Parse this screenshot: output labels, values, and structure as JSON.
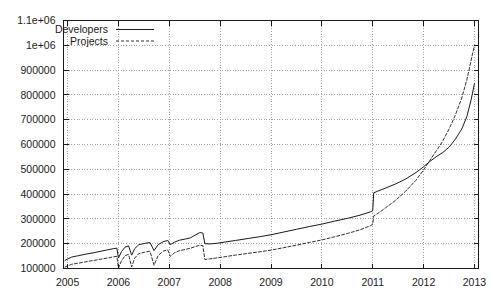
{
  "chart_data": {
    "type": "line",
    "title": "",
    "xlabel": "",
    "ylabel": "",
    "xlim": [
      2004.92,
      2013.08
    ],
    "ylim": [
      100000,
      1100000
    ],
    "grid": true,
    "legend_position": "top-left-inside",
    "xticks": [
      "2005",
      "2006",
      "2007",
      "2008",
      "2009",
      "2010",
      "2011",
      "2012",
      "2013"
    ],
    "xtick_values": [
      2005,
      2006,
      2007,
      2008,
      2009,
      2010,
      2011,
      2012,
      2013
    ],
    "yticks": [
      "100000",
      "200000",
      "300000",
      "400000",
      "500000",
      "600000",
      "700000",
      "800000",
      "900000",
      "1e+06",
      "1.1e+06"
    ],
    "ytick_values": [
      100000,
      200000,
      300000,
      400000,
      500000,
      600000,
      700000,
      800000,
      900000,
      1000000,
      1100000
    ],
    "series": [
      {
        "name": "Developers",
        "style": "solid",
        "color": "#1a1a1a",
        "points": [
          [
            2004.95,
            133000
          ],
          [
            2005.08,
            146000
          ],
          [
            2005.22,
            152000
          ],
          [
            2005.36,
            158000
          ],
          [
            2005.5,
            163000
          ],
          [
            2005.64,
            169000
          ],
          [
            2005.78,
            175000
          ],
          [
            2005.9,
            180000
          ],
          [
            2005.97,
            182000
          ],
          [
            2006.0,
            142000
          ],
          [
            2006.06,
            168000
          ],
          [
            2006.13,
            186000
          ],
          [
            2006.2,
            191000
          ],
          [
            2006.26,
            154000
          ],
          [
            2006.32,
            180000
          ],
          [
            2006.4,
            196000
          ],
          [
            2006.52,
            201000
          ],
          [
            2006.62,
            205000
          ],
          [
            2006.7,
            172000
          ],
          [
            2006.78,
            196000
          ],
          [
            2006.88,
            208000
          ],
          [
            2006.97,
            213000
          ],
          [
            2007.02,
            196000
          ],
          [
            2007.1,
            206000
          ],
          [
            2007.2,
            214000
          ],
          [
            2007.32,
            219000
          ],
          [
            2007.42,
            224000
          ],
          [
            2007.52,
            236000
          ],
          [
            2007.6,
            245000
          ],
          [
            2007.66,
            243000
          ],
          [
            2007.7,
            200000
          ],
          [
            2007.8,
            199000
          ],
          [
            2007.95,
            202000
          ],
          [
            2008.1,
            207000
          ],
          [
            2008.3,
            213000
          ],
          [
            2008.55,
            221000
          ],
          [
            2008.8,
            229000
          ],
          [
            2009.0,
            236000
          ],
          [
            2009.25,
            247000
          ],
          [
            2009.5,
            258000
          ],
          [
            2009.75,
            269000
          ],
          [
            2010.0,
            279000
          ],
          [
            2010.25,
            291000
          ],
          [
            2010.5,
            302000
          ],
          [
            2010.75,
            315000
          ],
          [
            2010.95,
            328000
          ],
          [
            2011.0,
            333000
          ],
          [
            2011.02,
            405000
          ],
          [
            2011.1,
            412000
          ],
          [
            2011.25,
            424000
          ],
          [
            2011.45,
            441000
          ],
          [
            2011.65,
            461000
          ],
          [
            2011.85,
            487000
          ],
          [
            2012.0,
            510000
          ],
          [
            2012.12,
            531000
          ],
          [
            2012.25,
            551000
          ],
          [
            2012.38,
            568000
          ],
          [
            2012.5,
            589000
          ],
          [
            2012.62,
            620000
          ],
          [
            2012.75,
            662000
          ],
          [
            2012.85,
            712000
          ],
          [
            2012.93,
            776000
          ],
          [
            2013.0,
            845000
          ]
        ]
      },
      {
        "name": "Projects",
        "style": "dashed",
        "color": "#1a1a1a",
        "points": [
          [
            2004.95,
            106000
          ],
          [
            2005.08,
            117000
          ],
          [
            2005.22,
            122000
          ],
          [
            2005.36,
            127000
          ],
          [
            2005.5,
            132000
          ],
          [
            2005.64,
            137000
          ],
          [
            2005.78,
            142000
          ],
          [
            2005.9,
            147000
          ],
          [
            2005.97,
            149000
          ],
          [
            2006.0,
            101000
          ],
          [
            2006.06,
            131000
          ],
          [
            2006.13,
            152000
          ],
          [
            2006.2,
            157000
          ],
          [
            2006.26,
            106000
          ],
          [
            2006.32,
            142000
          ],
          [
            2006.4,
            160000
          ],
          [
            2006.52,
            166000
          ],
          [
            2006.62,
            170000
          ],
          [
            2006.7,
            113000
          ],
          [
            2006.78,
            152000
          ],
          [
            2006.88,
            170000
          ],
          [
            2006.97,
            175000
          ],
          [
            2007.02,
            149000
          ],
          [
            2007.1,
            163000
          ],
          [
            2007.2,
            172000
          ],
          [
            2007.32,
            177000
          ],
          [
            2007.42,
            182000
          ],
          [
            2007.52,
            189000
          ],
          [
            2007.6,
            194000
          ],
          [
            2007.66,
            192000
          ],
          [
            2007.7,
            136000
          ],
          [
            2007.8,
            139000
          ],
          [
            2007.95,
            143000
          ],
          [
            2008.1,
            148000
          ],
          [
            2008.3,
            154000
          ],
          [
            2008.55,
            161000
          ],
          [
            2008.8,
            168000
          ],
          [
            2009.0,
            174000
          ],
          [
            2009.25,
            184000
          ],
          [
            2009.5,
            194000
          ],
          [
            2009.75,
            205000
          ],
          [
            2010.0,
            215000
          ],
          [
            2010.25,
            228000
          ],
          [
            2010.5,
            241000
          ],
          [
            2010.75,
            256000
          ],
          [
            2010.95,
            272000
          ],
          [
            2011.0,
            278000
          ],
          [
            2011.02,
            312000
          ],
          [
            2011.1,
            322000
          ],
          [
            2011.25,
            344000
          ],
          [
            2011.45,
            375000
          ],
          [
            2011.65,
            412000
          ],
          [
            2011.85,
            456000
          ],
          [
            2012.0,
            497000
          ],
          [
            2012.12,
            535000
          ],
          [
            2012.25,
            574000
          ],
          [
            2012.38,
            615000
          ],
          [
            2012.5,
            662000
          ],
          [
            2012.62,
            716000
          ],
          [
            2012.75,
            787000
          ],
          [
            2012.85,
            860000
          ],
          [
            2012.93,
            935000
          ],
          [
            2013.0,
            1000000
          ]
        ]
      }
    ]
  },
  "legend": {
    "entries": [
      {
        "label": "Developers",
        "style": "solid"
      },
      {
        "label": "Projects",
        "style": "dashed"
      }
    ]
  },
  "colors": {
    "axis": "#1a1a1a",
    "grid": "#8c8c8c",
    "line": "#1a1a1a",
    "background": "#ffffff"
  }
}
